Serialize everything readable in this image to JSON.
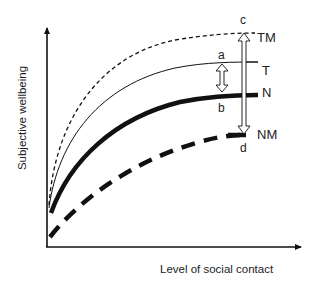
{
  "diagram": {
    "axes": {
      "x_label": "Level of social contact",
      "y_label": "Subjective wellbeing"
    },
    "curves": [
      {
        "id": "TM",
        "label": "TM",
        "style": "thin-dashed"
      },
      {
        "id": "T",
        "label": "T",
        "style": "thin-solid"
      },
      {
        "id": "N",
        "label": "N",
        "style": "thick-solid"
      },
      {
        "id": "NM",
        "label": "NM",
        "style": "thick-dashed"
      }
    ],
    "points": {
      "a": "a",
      "b": "b",
      "c": "c",
      "d": "d"
    },
    "arrows": [
      {
        "from": "a",
        "to": "b",
        "type": "double-headed"
      },
      {
        "from": "c",
        "to": "d",
        "type": "double-headed"
      }
    ],
    "colors": {
      "line": "#111111",
      "background": "#ffffff"
    }
  }
}
